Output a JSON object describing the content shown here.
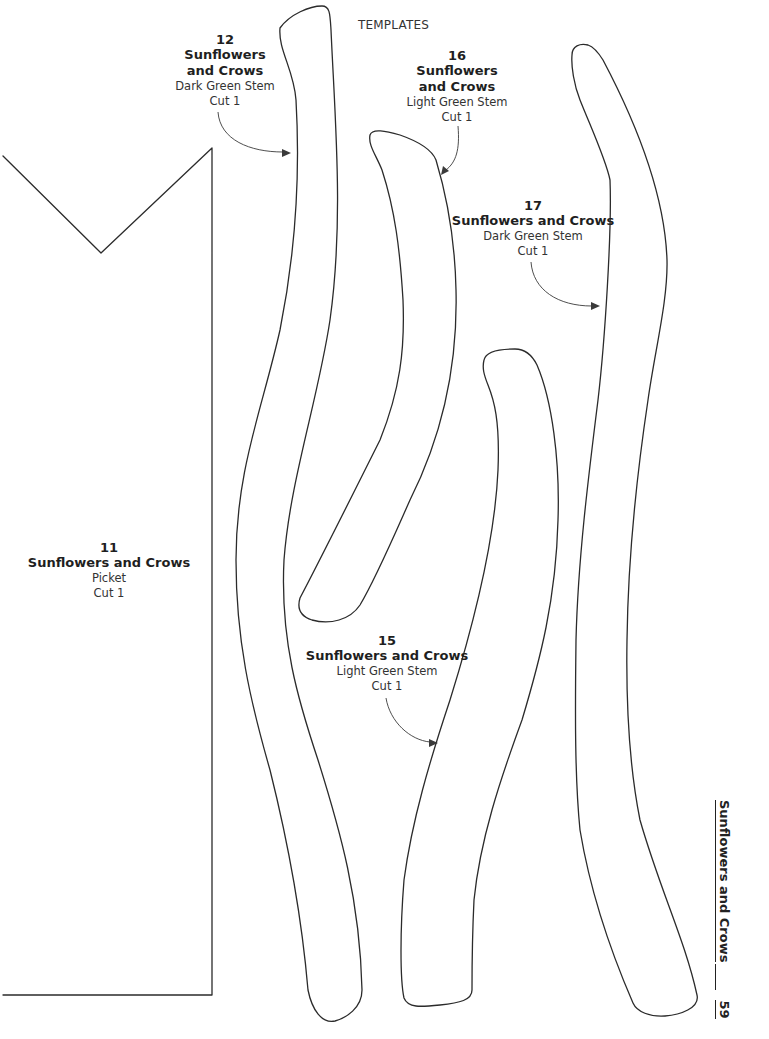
{
  "page": {
    "header": "TEMPLATES",
    "footer": {
      "title": "Sunflowers and Crows",
      "page_number": "59"
    }
  },
  "templates": [
    {
      "number": "11",
      "title": "Sunflowers and Crows",
      "title_lines": [
        "Sunflowers and Crows"
      ],
      "piece": "Picket",
      "cut": "Cut 1"
    },
    {
      "number": "12",
      "title": "Sunflowers and Crows",
      "title_lines": [
        "Sunflowers",
        "and Crows"
      ],
      "piece": "Dark Green Stem",
      "cut": "Cut 1"
    },
    {
      "number": "15",
      "title": "Sunflowers and Crows",
      "title_lines": [
        "Sunflowers and Crows"
      ],
      "piece": "Light Green Stem",
      "cut": "Cut 1"
    },
    {
      "number": "16",
      "title": "Sunflowers and Crows",
      "title_lines": [
        "Sunflowers",
        "and Crows"
      ],
      "piece": "Light Green Stem",
      "cut": "Cut 1"
    },
    {
      "number": "17",
      "title": "Sunflowers and Crows",
      "title_lines": [
        "Sunflowers and Crows"
      ],
      "piece": "Dark Green Stem",
      "cut": "Cut 1"
    }
  ]
}
